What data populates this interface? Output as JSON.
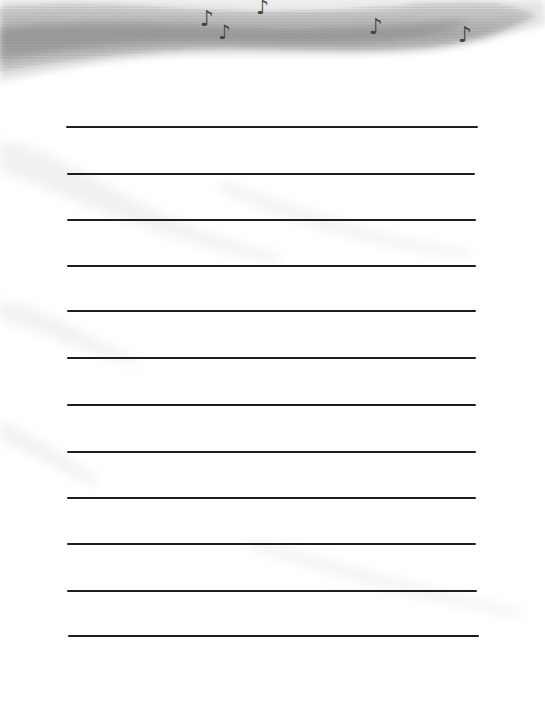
{
  "page": {
    "type": "lined-writing-paper",
    "background_color": "#ffffff",
    "header": {
      "style": "pencil-shaded swoosh",
      "shade_color": "#8c8c8c",
      "decoration_icon": "music-note-icon",
      "notes": [
        {
          "glyph": "♪",
          "x": 200,
          "y": 8,
          "size": 22
        },
        {
          "glyph": "♪",
          "x": 218,
          "y": 22,
          "size": 20
        },
        {
          "glyph": "♪",
          "x": 256,
          "y": -3,
          "size": 20
        },
        {
          "glyph": "♪",
          "x": 369,
          "y": 16,
          "size": 22
        },
        {
          "glyph": "♪",
          "x": 458,
          "y": 24,
          "size": 22
        }
      ]
    },
    "writing_lines": {
      "count": 12,
      "color": "#1e1e1e",
      "lines": [
        {
          "y": 126,
          "x1": 66,
          "x2": 478
        },
        {
          "y": 173,
          "x1": 67,
          "x2": 475
        },
        {
          "y": 219,
          "x1": 67,
          "x2": 476
        },
        {
          "y": 265,
          "x1": 67,
          "x2": 476
        },
        {
          "y": 310,
          "x1": 67,
          "x2": 476
        },
        {
          "y": 357,
          "x1": 67,
          "x2": 476
        },
        {
          "y": 404,
          "x1": 67,
          "x2": 476
        },
        {
          "y": 451,
          "x1": 67,
          "x2": 476
        },
        {
          "y": 497,
          "x1": 67,
          "x2": 476
        },
        {
          "y": 543,
          "x1": 67,
          "x2": 476
        },
        {
          "y": 590,
          "x1": 67,
          "x2": 477
        },
        {
          "y": 635,
          "x1": 68,
          "x2": 479
        }
      ]
    }
  }
}
